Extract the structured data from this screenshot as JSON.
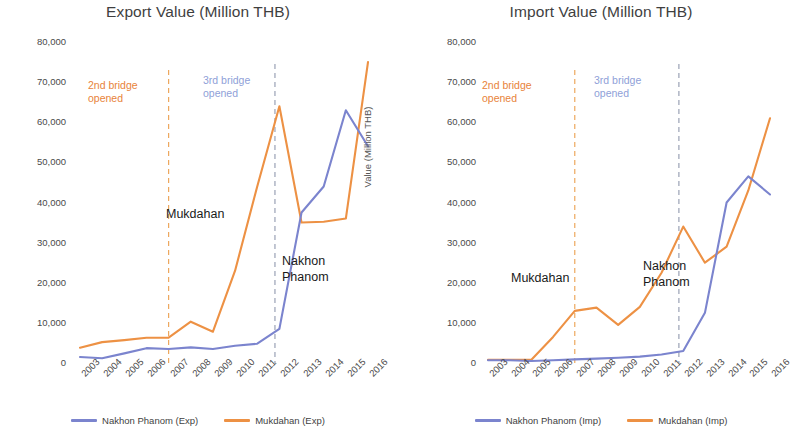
{
  "colors": {
    "nakhon_phanom": "#7b84ce",
    "mukdahan": "#ed9144",
    "bridge2_line": "#eda85e",
    "bridge3_line": "#9aa2b5",
    "text": "#3f3f3f"
  },
  "charts": [
    {
      "id": "export",
      "title": "Export Value (Million THB)",
      "ylabel": "Value (Million THB)",
      "yticks": [
        "80,000",
        "70,000",
        "60,000",
        "50,000",
        "40,000",
        "30,000",
        "20,000",
        "10,000",
        "0"
      ],
      "annotations": [
        {
          "name": "bridge2-annotation",
          "text": "2nd bridge\nopened",
          "style": "orange",
          "x": 88,
          "y": 79
        },
        {
          "name": "bridge3-annotation",
          "text": "3rd bridge\nopened",
          "style": "blue",
          "x": 203,
          "y": 74
        },
        {
          "name": "mukdahan-series-annotation",
          "text": "Mukdahan",
          "style": "black",
          "x": 166,
          "y": 206
        },
        {
          "name": "nakhon-phanom-series-annotation",
          "text": "Nakhon\nPhanom",
          "style": "black",
          "x": 282,
          "y": 253
        }
      ],
      "legend": [
        {
          "label": "Nakhon Phanom (Exp)",
          "color": "#7b84ce"
        },
        {
          "label": "Mukdahan (Exp)",
          "color": "#ed9144"
        }
      ]
    },
    {
      "id": "import",
      "title": "Import Value (Million THB)",
      "ylabel": "Value (Million THB)",
      "yticks": [
        "80,000",
        "70,000",
        "60,000",
        "50,000",
        "40,000",
        "30,000",
        "20,000",
        "10,000",
        "0"
      ],
      "annotations": [
        {
          "name": "bridge2-annotation",
          "text": "2nd bridge\nopened",
          "style": "orange",
          "x": 86,
          "y": 79
        },
        {
          "name": "bridge3-annotation",
          "text": "3rd bridge\nopened",
          "style": "blue",
          "x": 198,
          "y": 74
        },
        {
          "name": "mukdahan-series-annotation",
          "text": "Mukdahan",
          "style": "black",
          "x": 115,
          "y": 270
        },
        {
          "name": "nakhon-phanom-series-annotation",
          "text": "Nakhon\nPhanom",
          "style": "black",
          "x": 247,
          "y": 258
        }
      ],
      "legend": [
        {
          "label": "Nakhon Phanom (Imp)",
          "color": "#7b84ce"
        },
        {
          "label": "Mukdahan (Imp)",
          "color": "#ed9144"
        }
      ]
    }
  ],
  "chart_data": [
    {
      "type": "line",
      "title": "Export Value (Million THB)",
      "xlabel": "",
      "ylabel": "Value (Million THB)",
      "ylim": [
        0,
        80000
      ],
      "ytick_step": 10000,
      "grid": false,
      "legend_position": "bottom",
      "categories": [
        "2003",
        "2004",
        "2005",
        "2006",
        "2007",
        "2008",
        "2009",
        "2010",
        "2011",
        "2012",
        "2013",
        "2014",
        "2015",
        "2016"
      ],
      "series": [
        {
          "name": "Nakhon Phanom (Exp)",
          "color": "#7b84ce",
          "values": [
            1500,
            1200,
            2400,
            3700,
            3500,
            3900,
            3500,
            4300,
            4800,
            8500,
            37500,
            44000,
            63000,
            54000
          ]
        },
        {
          "name": "Mukdahan (Exp)",
          "color": "#ed9144",
          "values": [
            3800,
            5200,
            5700,
            6300,
            6300,
            10300,
            7800,
            23000,
            44000,
            64000,
            35000,
            35200,
            36000,
            75000
          ]
        }
      ],
      "annotations": [
        {
          "text": "2nd bridge opened",
          "type": "vline",
          "x": "2007",
          "color": "#eda85e",
          "style": "dashed"
        },
        {
          "text": "3rd bridge opened",
          "type": "vline",
          "x": "2011.8",
          "color": "#9aa2b5",
          "style": "dashed"
        },
        {
          "text": "Mukdahan",
          "type": "series-label"
        },
        {
          "text": "Nakhon Phanom",
          "type": "series-label"
        }
      ]
    },
    {
      "type": "line",
      "title": "Import Value (Million THB)",
      "xlabel": "",
      "ylabel": "Value (Million THB)",
      "ylim": [
        0,
        80000
      ],
      "ytick_step": 10000,
      "grid": false,
      "legend_position": "bottom",
      "categories": [
        "2003",
        "2004",
        "2005",
        "2006",
        "2007",
        "2008",
        "2009",
        "2010",
        "2011",
        "2012",
        "2013",
        "2014",
        "2015",
        "2016"
      ],
      "series": [
        {
          "name": "Nakhon Phanom (Imp)",
          "color": "#7b84ce",
          "values": [
            700,
            700,
            500,
            700,
            900,
            1100,
            1300,
            1600,
            2100,
            3000,
            12500,
            40000,
            46500,
            42000
          ]
        },
        {
          "name": "Mukdahan (Imp)",
          "color": "#ed9144",
          "values": [
            800,
            800,
            800,
            6500,
            13000,
            13800,
            9500,
            14000,
            22500,
            34000,
            25000,
            29000,
            43000,
            61000
          ]
        }
      ],
      "annotations": [
        {
          "text": "2nd bridge opened",
          "type": "vline",
          "x": "2007",
          "color": "#eda85e",
          "style": "dashed"
        },
        {
          "text": "3rd bridge opened",
          "type": "vline",
          "x": "2011.8",
          "color": "#9aa2b5",
          "style": "dashed"
        },
        {
          "text": "Mukdahan",
          "type": "series-label"
        },
        {
          "text": "Nakhon Phanom",
          "type": "series-label"
        }
      ]
    }
  ]
}
